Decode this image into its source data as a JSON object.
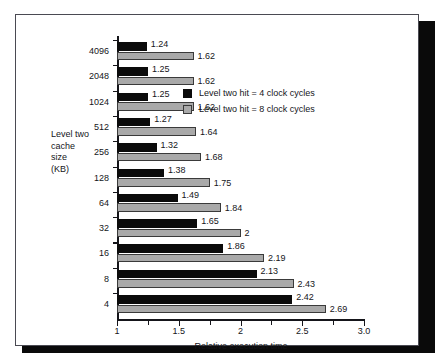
{
  "chart_data": {
    "type": "bar",
    "orientation": "horizontal",
    "title": "",
    "xlabel": "Relative execution time",
    "ylabel": "Level two cache size (KB)",
    "ylabel_lines": [
      "Level two",
      "cache",
      "size",
      "(KB)"
    ],
    "xlim": [
      1,
      3.0
    ],
    "xticks": [
      1,
      1.5,
      2,
      2.5,
      3.0
    ],
    "xtick_labels": [
      "1",
      "1.5",
      "2",
      "2.5",
      "3.0"
    ],
    "xminor_ticks": [
      1.25,
      1.75,
      2.25,
      2.75
    ],
    "grid": false,
    "legend_position": "upper right (inside plot)",
    "categories": [
      "4096",
      "2048",
      "1024",
      "512",
      "256",
      "128",
      "64",
      "32",
      "16",
      "8",
      "4"
    ],
    "series": [
      {
        "name": "Level two hit = 4 clock cycles",
        "color": "#0b0b0b",
        "values": [
          1.24,
          1.25,
          1.25,
          1.27,
          1.32,
          1.38,
          1.49,
          1.65,
          1.86,
          2.13,
          2.42
        ],
        "labels": [
          "1.24",
          "1.25",
          "1.25",
          "1.27",
          "1.32",
          "1.38",
          "1.49",
          "1.65",
          "1.86",
          "2.13",
          "2.42"
        ]
      },
      {
        "name": "Level two hit = 8 clock cycles",
        "color": "#a9a9a9",
        "values": [
          1.62,
          1.62,
          1.62,
          1.64,
          1.68,
          1.75,
          1.84,
          2,
          2.19,
          2.43,
          2.69
        ],
        "labels": [
          "1.62",
          "1.62",
          "1.62",
          "1.64",
          "1.68",
          "1.75",
          "1.84",
          "2",
          "2.19",
          "2.43",
          "2.69"
        ]
      }
    ]
  },
  "legend": {
    "entries": [
      {
        "label": "Level two hit = 4 clock cycles",
        "swatch": "dark"
      },
      {
        "label": "Level two hit = 8 clock cycles",
        "swatch": "light"
      }
    ]
  }
}
